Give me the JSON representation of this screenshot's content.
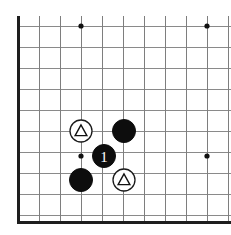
{
  "figure": {
    "kind": "go-board-diagram",
    "width": 231,
    "height": 235
  },
  "colors": {
    "background": "#ffffff",
    "grid_line": "#8a8a8a",
    "board_edge": "#1e1e1e",
    "black_stone": "#0d0d0d",
    "white_stone": "#ffffff",
    "stone_outline": "#1a1a1a",
    "mark": "#111111",
    "label_text": "#ffffff"
  },
  "board": {
    "cell_size": 21,
    "origin_x": 18,
    "origin_y": 26,
    "columns": 11,
    "rows": 10,
    "left_edge_x": 18,
    "bottom_edge_y": 222,
    "vertical_line_xs": [
      18,
      39,
      60,
      81,
      102,
      123,
      144,
      165,
      186,
      207,
      228
    ],
    "horizontal_line_ys": [
      26,
      47,
      68,
      89,
      110,
      131,
      152,
      173,
      194,
      215,
      222
    ],
    "star_points": [
      {
        "name": "star-point-top-left",
        "x": 81,
        "y": 26
      },
      {
        "name": "star-point-top-right",
        "x": 207,
        "y": 26
      },
      {
        "name": "star-point-mid-left",
        "x": 81,
        "y": 156
      },
      {
        "name": "star-point-mid-right",
        "x": 207,
        "y": 156
      }
    ]
  },
  "stones": [
    {
      "name": "white-stone-triangle-upper",
      "color": "white",
      "x": 81,
      "y": 131,
      "radius": 11,
      "mark": "triangle",
      "label": ""
    },
    {
      "name": "black-stone-upper-right",
      "color": "black",
      "x": 124,
      "y": 131,
      "radius": 11.5,
      "mark": "",
      "label": ""
    },
    {
      "name": "black-stone-move-1",
      "color": "black",
      "x": 104,
      "y": 156,
      "radius": 11.5,
      "mark": "",
      "label": "1"
    },
    {
      "name": "black-stone-lower-left",
      "color": "black",
      "x": 81,
      "y": 180,
      "radius": 11.5,
      "mark": "",
      "label": ""
    },
    {
      "name": "white-stone-triangle-lower",
      "color": "white",
      "x": 124,
      "y": 180,
      "radius": 11,
      "mark": "triangle",
      "label": ""
    }
  ]
}
